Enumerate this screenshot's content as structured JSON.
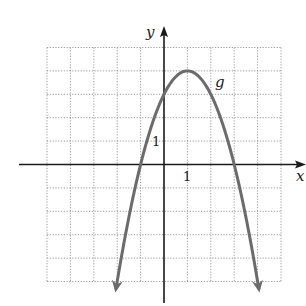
{
  "chart_data": {
    "type": "line",
    "title": "",
    "xlabel": "x",
    "ylabel": "y",
    "function_label": "g",
    "function": "g(x) = -(x - 1)^2 + 4",
    "series": [
      {
        "name": "g",
        "x": [
          -2.05,
          -2,
          -1.5,
          -1,
          -0.5,
          0,
          0.5,
          1,
          1.5,
          2,
          2.5,
          3,
          3.5,
          4,
          4.05
        ],
        "y": [
          -5.3,
          -5,
          -2.25,
          0,
          1.75,
          3,
          3.75,
          4,
          3.75,
          3,
          1.75,
          0,
          -2.25,
          -5,
          -5.3
        ],
        "end_arrows": true
      }
    ],
    "key_points": {
      "vertex": [
        1,
        4
      ],
      "y_intercept": [
        0,
        3
      ],
      "x_intercepts": [
        [
          -1,
          0
        ],
        [
          3,
          0
        ]
      ]
    },
    "tick_labels": {
      "x": [
        {
          "value": 1,
          "label": "1"
        }
      ],
      "y": [
        {
          "value": 1,
          "label": "1"
        }
      ]
    },
    "xlim": [
      -5,
      5
    ],
    "ylim": [
      -5,
      5
    ],
    "grid": true,
    "grid_style": "dotted",
    "legend": null
  },
  "colors": {
    "curve": "#6b6b6b",
    "axes": "#1a1a1a",
    "grid": "#9a9a9a",
    "background": "#ffffff"
  },
  "labels": {
    "x_axis": "x",
    "y_axis": "y",
    "curve": "g",
    "x_tick": "1",
    "y_tick": "1"
  }
}
